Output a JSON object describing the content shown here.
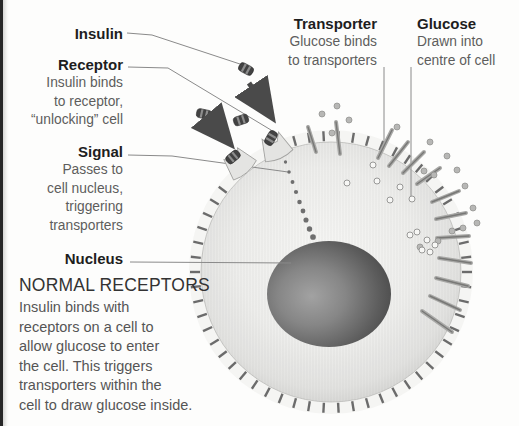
{
  "figure": {
    "left_labels": {
      "insulin": {
        "title": "Insulin"
      },
      "receptor": {
        "title": "Receptor",
        "body": "Insulin binds\nto receptor,\n“unlocking” cell"
      },
      "signal": {
        "title": "Signal",
        "body": "Passes to\ncell nucleus,\ntriggering\ntransporters"
      },
      "nucleus": {
        "title": "Nucleus"
      }
    },
    "right_labels": {
      "transporter": {
        "title": "Transporter",
        "body": "Glucose binds\nto transporters"
      },
      "glucose": {
        "title": "Glucose",
        "body": "Drawn into\ncentre of cell"
      }
    },
    "caption": {
      "heading": "NORMAL RECEPTORS",
      "body": "Insulin binds with\nreceptors on a cell to\nallow glucose to enter\nthe cell. This triggers\ntransporters within the\ncell to draw glucose inside."
    },
    "colors": {
      "ink": "#1e1e1e",
      "body_text": "#5d5d5d",
      "heading_text": "#333333",
      "leader_line": "#8a8a8a",
      "membrane_tick": "#6b6b6b",
      "cell_edge": "#c9c9c7",
      "nucleus_dark": "#3e3e3e",
      "glucose_dot": "#b7b7b5",
      "insulin_capsule": "#3f3f3f"
    }
  }
}
